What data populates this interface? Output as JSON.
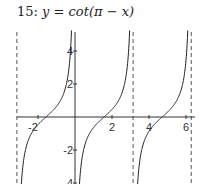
{
  "title": {
    "number": "15:",
    "expression": "y = cot(π − x)"
  },
  "chart_data": {
    "type": "line",
    "title": "15: y = cot(π − x)",
    "function": "cot(pi - x)",
    "xlabel": "",
    "ylabel": "",
    "xlim": [
      -3.14,
      6.28
    ],
    "ylim": [
      -4.1,
      5.2
    ],
    "x_ticks": [
      -2,
      2,
      4,
      6
    ],
    "x_tick_labels": [
      "-2",
      "2",
      "4",
      "6"
    ],
    "y_ticks": [
      4,
      2,
      -2,
      -4
    ],
    "y_tick_labels": [
      "4",
      "2",
      "-2",
      "-4"
    ],
    "asymptotes_x": [
      -3.14159,
      0,
      3.14159,
      6.28319
    ],
    "asymptote_style": "dashed (except at x=0 which coincides with y-axis)",
    "grid": false,
    "legend": null,
    "series": [
      {
        "name": "branch (-π, 0)",
        "x": [
          -3.0,
          -2.5,
          -1.5708,
          -0.6,
          -0.25
        ],
        "y": [
          -7.0,
          -1.34,
          0,
          1.46,
          3.92
        ]
      },
      {
        "name": "branch (0, π)",
        "x": [
          0.25,
          0.6,
          1.5708,
          2.5,
          3.0
        ],
        "y": [
          -3.92,
          -1.46,
          0,
          1.34,
          7.0
        ]
      },
      {
        "name": "branch (π, 2π)",
        "x": [
          3.4,
          3.8,
          4.7124,
          5.6,
          6.0
        ],
        "y": [
          -3.86,
          -1.28,
          0,
          1.52,
          3.56
        ]
      }
    ]
  },
  "axes": {
    "x_tick_labels": [
      "-2",
      "2",
      "4",
      "6"
    ],
    "y_tick_labels": [
      "4",
      "2",
      "-2",
      "-4"
    ]
  }
}
